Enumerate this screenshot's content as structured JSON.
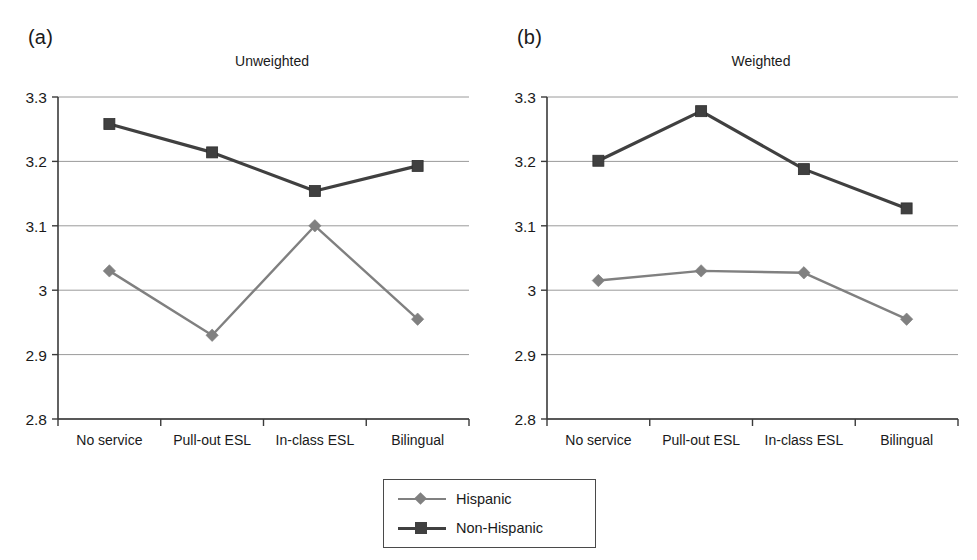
{
  "figure": {
    "background": "#ffffff",
    "panels": [
      {
        "letter": "(a)",
        "title": "Unweighted"
      },
      {
        "letter": "(b)",
        "title": "Weighted"
      }
    ]
  },
  "legend": {
    "position": "bottom-center",
    "border_color": "#4a4a4a",
    "entries": [
      {
        "label": "Hispanic",
        "color": "#808080",
        "marker": "diamond"
      },
      {
        "label": "Non-Hispanic",
        "color": "#404040",
        "marker": "square"
      }
    ]
  },
  "axis": {
    "y_ticks": [
      "3.3",
      "3.2",
      "3.1",
      "3",
      "2.9",
      "2.8"
    ],
    "y_tick_values": [
      3.3,
      3.2,
      3.1,
      3.0,
      2.9,
      2.8
    ],
    "x_categories": [
      "No service",
      "Pull-out ESL",
      "In-class ESL",
      "Bilingual"
    ],
    "grid": true,
    "grid_color": "#9a9a9a"
  },
  "chart_data": [
    {
      "type": "line",
      "title": "Unweighted",
      "panel": "(a)",
      "xlabel": "",
      "ylabel": "",
      "categories": [
        "No service",
        "Pull-out ESL",
        "In-class ESL",
        "Bilingual"
      ],
      "ylim": [
        2.8,
        3.3
      ],
      "yticks": [
        2.8,
        2.9,
        3.0,
        3.1,
        3.2,
        3.3
      ],
      "grid": true,
      "legend_position": "below-figure",
      "series": [
        {
          "name": "Hispanic",
          "color": "#808080",
          "marker": "diamond",
          "values": [
            3.03,
            2.93,
            3.1,
            2.955
          ]
        },
        {
          "name": "Non-Hispanic",
          "color": "#404040",
          "marker": "square",
          "values": [
            3.258,
            3.214,
            3.154,
            3.193
          ]
        }
      ]
    },
    {
      "type": "line",
      "title": "Weighted",
      "panel": "(b)",
      "xlabel": "",
      "ylabel": "",
      "categories": [
        "No service",
        "Pull-out ESL",
        "In-class ESL",
        "Bilingual"
      ],
      "ylim": [
        2.8,
        3.3
      ],
      "yticks": [
        2.8,
        2.9,
        3.0,
        3.1,
        3.2,
        3.3
      ],
      "grid": true,
      "legend_position": "below-figure",
      "series": [
        {
          "name": "Hispanic",
          "color": "#808080",
          "marker": "diamond",
          "values": [
            3.015,
            3.03,
            3.027,
            2.955
          ]
        },
        {
          "name": "Non-Hispanic",
          "color": "#404040",
          "marker": "square",
          "values": [
            3.201,
            3.278,
            3.188,
            3.127
          ]
        }
      ]
    }
  ]
}
